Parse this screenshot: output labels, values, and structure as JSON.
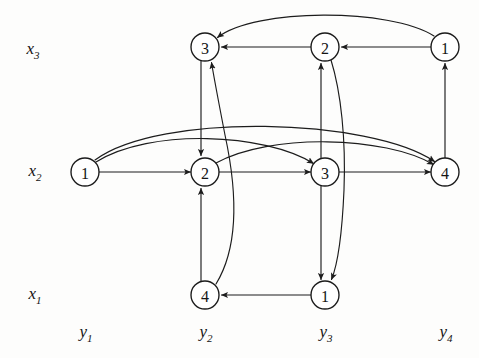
{
  "figure": {
    "kind": "layered-directed-graph",
    "width": 479,
    "height": 358,
    "background_color": "#fdfdfc",
    "ink_color": "#1a1a1a"
  },
  "row_labels": [
    {
      "id": "x3",
      "text": "x",
      "sub": "3",
      "x": 33,
      "y": 50
    },
    {
      "id": "x2",
      "text": "x",
      "sub": "2",
      "x": 35,
      "y": 172
    },
    {
      "id": "x1",
      "text": "x",
      "sub": "1",
      "x": 35,
      "y": 295
    }
  ],
  "col_labels": [
    {
      "id": "y1",
      "text": "y",
      "sub": "1",
      "x": 86,
      "y": 333
    },
    {
      "id": "y2",
      "text": "y",
      "sub": "2",
      "x": 206,
      "y": 333
    },
    {
      "id": "y3",
      "text": "y",
      "sub": "3",
      "x": 326,
      "y": 333
    },
    {
      "id": "y4",
      "text": "y",
      "sub": "4",
      "x": 446,
      "y": 333
    }
  ],
  "nodes": [
    {
      "id": "x3c2",
      "label": "3",
      "cx": 205,
      "cy": 47,
      "r": 14,
      "row": "x3",
      "col": "y2"
    },
    {
      "id": "x3c3",
      "label": "2",
      "cx": 325,
      "cy": 47,
      "r": 14,
      "row": "x3",
      "col": "y3"
    },
    {
      "id": "x3c4",
      "label": "1",
      "cx": 445,
      "cy": 47,
      "r": 14,
      "row": "x3",
      "col": "y4"
    },
    {
      "id": "x2c1",
      "label": "1",
      "cx": 85,
      "cy": 172,
      "r": 14,
      "row": "x2",
      "col": "y1"
    },
    {
      "id": "x2c2",
      "label": "2",
      "cx": 205,
      "cy": 172,
      "r": 14,
      "row": "x2",
      "col": "y2"
    },
    {
      "id": "x2c3",
      "label": "3",
      "cx": 325,
      "cy": 172,
      "r": 14,
      "row": "x2",
      "col": "y3"
    },
    {
      "id": "x2c4",
      "label": "4",
      "cx": 445,
      "cy": 172,
      "r": 14,
      "row": "x2",
      "col": "y4"
    },
    {
      "id": "x1c2",
      "label": "4",
      "cx": 205,
      "cy": 295,
      "r": 14,
      "row": "x1",
      "col": "y2"
    },
    {
      "id": "x1c3",
      "label": "1",
      "cx": 325,
      "cy": 295,
      "r": 14,
      "row": "x1",
      "col": "y3"
    }
  ],
  "edges": [
    {
      "id": "e1",
      "from": "x3c4",
      "to": "x3c3",
      "shape": "straight",
      "note": "top row 1 to 2"
    },
    {
      "id": "e2",
      "from": "x3c3",
      "to": "x3c2",
      "shape": "straight",
      "note": "top row 2 to 3"
    },
    {
      "id": "e3",
      "from": "x3c4",
      "to": "x3c2",
      "shape": "arc-over",
      "note": "top row 1 to 3 long arc"
    },
    {
      "id": "e4",
      "from": "x2c1",
      "to": "x2c2",
      "shape": "straight",
      "note": "mid row 1 to 2"
    },
    {
      "id": "e5",
      "from": "x2c2",
      "to": "x2c3",
      "shape": "straight",
      "note": "mid row 2 to 3"
    },
    {
      "id": "e6",
      "from": "x2c3",
      "to": "x2c4",
      "shape": "straight",
      "note": "mid row 3 to 4"
    },
    {
      "id": "e7",
      "from": "x2c1",
      "to": "x2c3",
      "shape": "arc-over",
      "note": "mid row 1 to 3 arc"
    },
    {
      "id": "e8",
      "from": "x2c1",
      "to": "x2c4",
      "shape": "arc-over",
      "note": "mid row 1 to 4 long arc"
    },
    {
      "id": "e9",
      "from": "x2c2",
      "to": "x2c4",
      "shape": "arc-over",
      "note": "mid row 2 to 4 arc"
    },
    {
      "id": "e10",
      "from": "x1c3",
      "to": "x1c2",
      "shape": "straight",
      "note": "bottom row 1 to 4"
    },
    {
      "id": "e11",
      "from": "x3c2",
      "to": "x2c2",
      "shape": "vertical",
      "note": "column y2 down 3 to 2"
    },
    {
      "id": "e12",
      "from": "x2c3",
      "to": "x3c3",
      "shape": "vertical",
      "note": "column y3 up 3 to 2"
    },
    {
      "id": "e13",
      "from": "x2c4",
      "to": "x3c4",
      "shape": "vertical",
      "note": "column y4 up 4 to 1"
    },
    {
      "id": "e14",
      "from": "x1c2",
      "to": "x2c2",
      "shape": "vertical",
      "note": "column y2 up 4 to 2"
    },
    {
      "id": "e15",
      "from": "x2c3",
      "to": "x1c3",
      "shape": "vertical",
      "note": "column y3 down 3 to 1"
    },
    {
      "id": "e16",
      "from": "x1c2",
      "to": "x3c2",
      "shape": "curve",
      "note": "bottom 4 up to top 3"
    },
    {
      "id": "e17",
      "from": "x3c3",
      "to": "x1c3",
      "shape": "curve",
      "note": "top 2 down to bottom 1"
    }
  ],
  "accessibility": {
    "summary": "Three-level layered directed graph with rows x1, x2, x3 and columns y1 through y4. Circled numeric nodes connected by straight, arced and curved arrows."
  }
}
